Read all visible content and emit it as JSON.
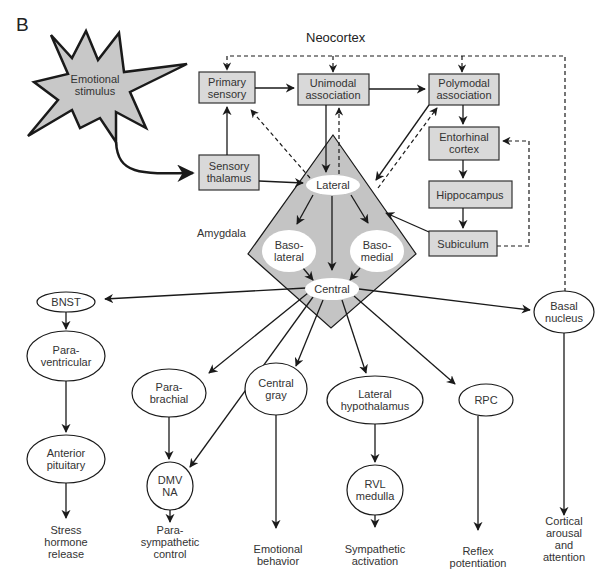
{
  "figure": {
    "panel_letter": "B",
    "heading": "Neocortex",
    "region_label": "Amygdala",
    "caption": "",
    "colors": {
      "box_fill": "#d9d9d9",
      "amygdala_fill": "#c4c4c4",
      "starburst_fill": "#c8c8c8",
      "line": "#1a1a1a",
      "nucleus_fill": "#ffffff"
    }
  },
  "stimulus": {
    "label": "Emotional\nstimulus"
  },
  "cortex_boxes": [
    {
      "id": "primary",
      "label": "Primary\nsensory"
    },
    {
      "id": "unimodal",
      "label": "Unimodal\nassociation"
    },
    {
      "id": "polymodal",
      "label": "Polymodal\nassociation"
    },
    {
      "id": "thalamus",
      "label": "Sensory\nthalamus"
    },
    {
      "id": "entorhinal",
      "label": "Entorhinal\ncortex"
    },
    {
      "id": "hippocampus",
      "label": "Hippocampus"
    },
    {
      "id": "subiculum",
      "label": "Subiculum"
    }
  ],
  "amygdala_nuclei": [
    {
      "id": "lateral",
      "label": "Lateral"
    },
    {
      "id": "basolateral",
      "label": "Baso-\nlateral"
    },
    {
      "id": "basomedial",
      "label": "Baso-\nmedial"
    },
    {
      "id": "central",
      "label": "Central"
    }
  ],
  "targets": [
    {
      "id": "bnst",
      "label": "BNST"
    },
    {
      "id": "paraventricular",
      "label": "Para-\nventricular"
    },
    {
      "id": "anterior_pituitary",
      "label": "Anterior\npituitary"
    },
    {
      "id": "parabrachial",
      "label": "Para-\nbrachial"
    },
    {
      "id": "dmv_na",
      "label": "DMV\nNA"
    },
    {
      "id": "central_gray",
      "label": "Central\ngray"
    },
    {
      "id": "lateral_hypothalamus",
      "label": "Lateral\nhypothalamus"
    },
    {
      "id": "rvl_medulla",
      "label": "RVL\nmedulla"
    },
    {
      "id": "rpc",
      "label": "RPC"
    },
    {
      "id": "basal_nucleus",
      "label": "Basal\nnucleus"
    }
  ],
  "outputs": [
    {
      "id": "stress",
      "label": "Stress\nhormone\nrelease"
    },
    {
      "id": "parasympathetic",
      "label": "Para-\nsympathetic\ncontrol"
    },
    {
      "id": "emotional_behavior",
      "label": "Emotional\nbehavior"
    },
    {
      "id": "sympathetic",
      "label": "Sympathetic\nactivation"
    },
    {
      "id": "reflex",
      "label": "Reflex\npotentiation"
    },
    {
      "id": "cortical_arousal",
      "label": "Cortical\narousal and\nattention"
    }
  ]
}
